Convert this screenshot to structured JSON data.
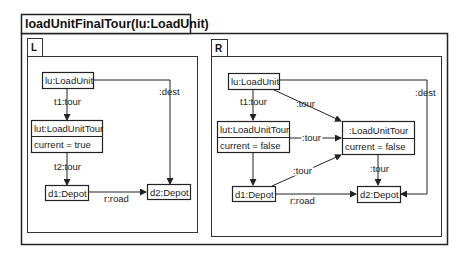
{
  "diagram": {
    "title": "loadUnitFinalTour(lu:LoadUnit)",
    "left": {
      "label": "L",
      "nodes": {
        "lu": "lu:LoadUnit",
        "lut": "lut:LoadUnitTour",
        "lut_attr": "current = true",
        "d1": "d1:Depot",
        "d2": "d2:Depot"
      },
      "edges": {
        "t1": "t1:tour",
        "t2": "t2:tour",
        "dest": ":dest",
        "road": "r:road"
      }
    },
    "right": {
      "label": "R",
      "nodes": {
        "lu": "lu:LoadUnit",
        "lut": "lut:LoadUnitTour",
        "lut_attr": "current = false",
        "newlut": ":LoadUnitTour",
        "newlut_attr": "current = false",
        "d1": "d1:Depot",
        "d2": "d2:Depot"
      },
      "edges": {
        "t1": "t1:tour",
        "lu_new": ":tour",
        "lut_new": ":tour",
        "d1_new": ":tour",
        "new_d2": ":tour",
        "dest": ":dest",
        "road": "r:road"
      }
    }
  }
}
